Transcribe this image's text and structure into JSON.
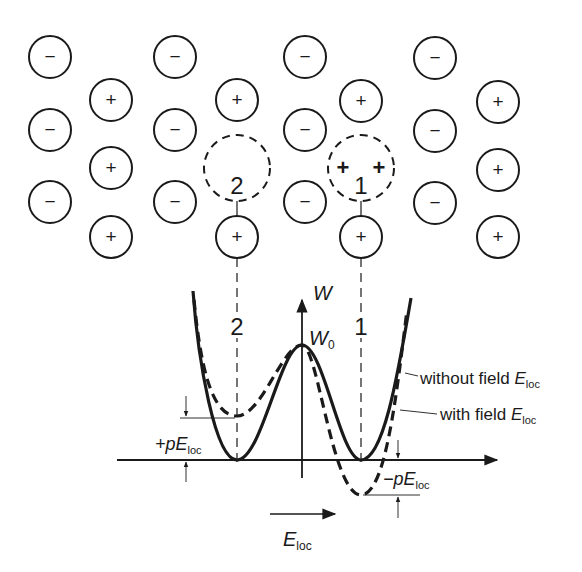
{
  "lattice": {
    "anions": [
      {
        "x": 50,
        "y": 57
      },
      {
        "x": 50,
        "y": 130
      },
      {
        "x": 50,
        "y": 202
      },
      {
        "x": 175,
        "y": 57
      },
      {
        "x": 175,
        "y": 130
      },
      {
        "x": 175,
        "y": 202
      },
      {
        "x": 305,
        "y": 57
      },
      {
        "x": 305,
        "y": 130
      },
      {
        "x": 305,
        "y": 202
      },
      {
        "x": 435,
        "y": 58
      },
      {
        "x": 435,
        "y": 131
      },
      {
        "x": 435,
        "y": 203
      }
    ],
    "cations": [
      {
        "x": 111,
        "y": 100
      },
      {
        "x": 111,
        "y": 168
      },
      {
        "x": 111,
        "y": 237
      },
      {
        "x": 237,
        "y": 100
      },
      {
        "x": 237,
        "y": 237
      },
      {
        "x": 361,
        "y": 101
      },
      {
        "x": 361,
        "y": 237
      },
      {
        "x": 498,
        "y": 102
      },
      {
        "x": 498,
        "y": 170
      },
      {
        "x": 498,
        "y": 237
      }
    ],
    "anion_symbol": "−",
    "cation_symbol": "+",
    "vacancies": [
      {
        "id": "2",
        "label": "2",
        "x": 237,
        "y": 168
      },
      {
        "id": "1",
        "label": "1",
        "x": 361,
        "y": 168,
        "inner_symbols": [
          "+",
          "+"
        ]
      }
    ]
  },
  "plot": {
    "y_axis_label": "W",
    "peak_label": "W",
    "peak_label_sub": "0",
    "position_labels": [
      "2",
      "1"
    ],
    "legend": {
      "without_field": {
        "text": "without field ",
        "var": "E",
        "sub": "loc"
      },
      "with_field": {
        "text": "with field ",
        "var": "E",
        "sub": "loc"
      }
    },
    "plus_shift": {
      "prefix": "+p",
      "var": "E",
      "sub": "loc"
    },
    "minus_shift": {
      "prefix": "−p",
      "var": "E",
      "sub": "loc"
    },
    "field_arrow": {
      "var": "E",
      "sub": "loc"
    }
  },
  "colors": {
    "ink": "#1a1a1a",
    "background": "#ffffff"
  }
}
